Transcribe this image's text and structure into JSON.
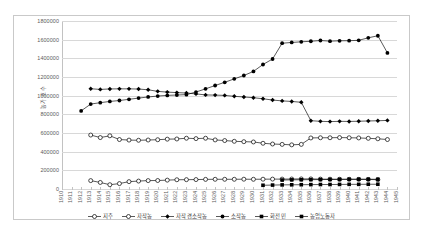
{
  "chart_data": {
    "type": "line",
    "title": "",
    "xlabel": "",
    "ylabel": "농가 호수",
    "ylim": [
      0,
      1800000
    ],
    "ytick_step": 200000,
    "grid": true,
    "legend_position": "bottom",
    "ytick_labels": [
      "0",
      "200000",
      "400000",
      "600000",
      "800000",
      "1000000",
      "1200000",
      "1400000",
      "1600000",
      "1800000"
    ],
    "categories": [
      "1910",
      "1911",
      "1912",
      "1913",
      "1914",
      "1915",
      "1916",
      "1917",
      "1918",
      "1919",
      "1920",
      "1921",
      "1922",
      "1923",
      "1924",
      "1925",
      "1926",
      "1927",
      "1928",
      "1929",
      "1930",
      "1931",
      "1932",
      "1933",
      "1934",
      "1935",
      "1936",
      "1937",
      "1938",
      "1939",
      "1940",
      "1941",
      "1942",
      "1943",
      "1944",
      "1945"
    ],
    "series": [
      {
        "name": "지주",
        "marker": "open-circle",
        "color": "#000000",
        "values": [
          null,
          null,
          null,
          90000,
          70000,
          46000,
          58000,
          79000,
          85000,
          90000,
          91000,
          95000,
          99000,
          100000,
          101000,
          103000,
          104000,
          104000,
          104000,
          105000,
          104000,
          105000,
          106000,
          106000,
          107000,
          108000,
          108000,
          106000,
          105000,
          104000,
          104000,
          103000,
          102000,
          100000,
          null,
          null
        ]
      },
      {
        "name": "자작농",
        "marker": "open-circle",
        "color": "#000000",
        "values": [
          null,
          null,
          null,
          578000,
          551000,
          570000,
          530000,
          524000,
          522000,
          525000,
          528000,
          534000,
          536000,
          544000,
          540000,
          544000,
          526000,
          519000,
          511000,
          507000,
          504000,
          490000,
          482000,
          478000,
          473000,
          478000,
          547000,
          549000,
          549000,
          551000,
          549000,
          547000,
          543000,
          538000,
          530000,
          null
        ]
      },
      {
        "name": "자작겸소작농",
        "marker": "filled-diamond",
        "color": "#000000",
        "values": [
          null,
          null,
          null,
          1074000,
          1067000,
          1072000,
          1073000,
          1073000,
          1071000,
          1063000,
          1046000,
          1038000,
          1033000,
          1028000,
          1019000,
          1008000,
          1006000,
          1003000,
          993000,
          986000,
          978000,
          967000,
          953000,
          944000,
          938000,
          929000,
          732000,
          725000,
          722000,
          725000,
          724000,
          726000,
          729000,
          731000,
          735000,
          null
        ]
      },
      {
        "name": "소작농",
        "marker": "filled-circle",
        "color": "#000000",
        "values": [
          null,
          null,
          837000,
          910000,
          925000,
          938000,
          948000,
          961000,
          974000,
          986000,
          996000,
          1003000,
          1007000,
          1011000,
          1039000,
          1073000,
          1109000,
          1143000,
          1180000,
          1216000,
          1260000,
          1334000,
          1393000,
          1562000,
          1570000,
          1577000,
          1583000,
          1591000,
          1584000,
          1588000,
          1589000,
          1593000,
          1620000,
          1642000,
          1458000,
          null
        ]
      },
      {
        "name": "화전민",
        "marker": "filled-square",
        "color": "#000000",
        "values": [
          null,
          null,
          null,
          null,
          null,
          null,
          null,
          null,
          null,
          null,
          null,
          null,
          null,
          null,
          null,
          null,
          null,
          null,
          null,
          null,
          null,
          null,
          null,
          96000,
          98000,
          99000,
          100000,
          101000,
          102000,
          103000,
          104000,
          105000,
          105000,
          104000,
          null,
          null
        ]
      },
      {
        "name": "농업노동자",
        "marker": "filled-square",
        "color": "#000000",
        "values": [
          null,
          null,
          null,
          null,
          null,
          null,
          null,
          null,
          null,
          null,
          null,
          null,
          null,
          null,
          null,
          null,
          null,
          null,
          null,
          null,
          null,
          40000,
          42000,
          44000,
          45000,
          46000,
          47000,
          48000,
          48000,
          49000,
          50000,
          50000,
          51000,
          51000,
          null,
          null
        ]
      }
    ]
  },
  "legend": {
    "items": [
      {
        "label": "지주",
        "marker": "open-circle"
      },
      {
        "label": "자작농",
        "marker": "open-circle"
      },
      {
        "label": "자작겸소작농",
        "marker": "filled-diamond"
      },
      {
        "label": "소작농",
        "marker": "filled-circle"
      },
      {
        "label": "화전민",
        "marker": "filled-square"
      },
      {
        "label": "농업노동자",
        "marker": "filled-square"
      }
    ]
  }
}
